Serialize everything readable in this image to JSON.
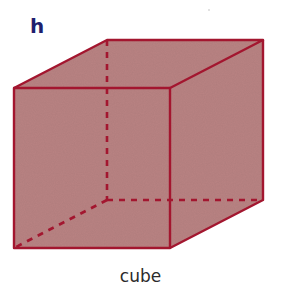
{
  "figure": {
    "label": "h",
    "caption": "cube",
    "shape": "cube",
    "colors": {
      "fill": "#b98383",
      "edge": "#a3162f",
      "label": "#1f1f6e",
      "caption": "#2b2b2b"
    },
    "vertices": {
      "front_top_left": [
        14,
        88
      ],
      "front_top_right": [
        170,
        88
      ],
      "front_bottom_right": [
        170,
        248
      ],
      "front_bottom_left": [
        14,
        248
      ],
      "back_top_left": [
        107,
        40
      ],
      "back_top_right": [
        263,
        40
      ],
      "back_bottom_right": [
        263,
        200
      ],
      "back_bottom_left": [
        107,
        200
      ]
    },
    "edges": {
      "visible": [
        "front face",
        "top face",
        "right face"
      ],
      "hidden_dashed": [
        "back_top_left-back_bottom_left",
        "back_bottom_left-back_bottom_right",
        "back_bottom_left-front_bottom_left"
      ]
    }
  }
}
